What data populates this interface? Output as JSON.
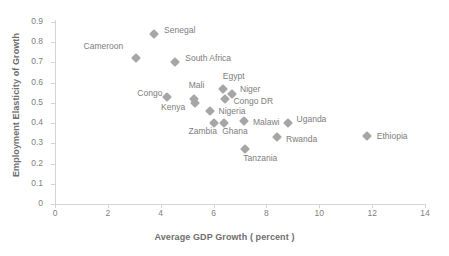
{
  "chart_data": {
    "type": "scatter",
    "title": "",
    "xlabel": "Average GDP Growth ( percent )",
    "ylabel": "Employment Elasticity of Growth",
    "xlim": [
      0,
      14
    ],
    "ylim": [
      0,
      0.9
    ],
    "xticks": [
      "0",
      "2",
      "4",
      "6",
      "8",
      "10",
      "12",
      "14"
    ],
    "yticks": [
      "0",
      "0.1",
      "0.2",
      "0.3",
      "0.4",
      "0.5",
      "0.6",
      "0.7",
      "0.8",
      "0.9"
    ],
    "grid": false,
    "legend": false,
    "marker_color": "#a6a6a6",
    "axis_color": "#d4d4d4",
    "points": [
      {
        "label": "Senegal",
        "x": 3.75,
        "y": 0.84,
        "lx": 10,
        "ly": -4
      },
      {
        "label": "Cameroon",
        "x": 3.05,
        "y": 0.72,
        "lx": -52,
        "ly": -12
      },
      {
        "label": "South Africa",
        "x": 4.55,
        "y": 0.7,
        "lx": 10,
        "ly": -4
      },
      {
        "label": "Congo",
        "x": 4.25,
        "y": 0.53,
        "lx": -30,
        "ly": -4
      },
      {
        "label": "Mali",
        "x": 5.25,
        "y": 0.52,
        "lx": -5,
        "ly": -14
      },
      {
        "label": "Kenya",
        "x": 5.3,
        "y": 0.5,
        "lx": -34,
        "ly": 4
      },
      {
        "label": "Egypt",
        "x": 6.35,
        "y": 0.57,
        "lx": 0,
        "ly": -13
      },
      {
        "label": "Niger",
        "x": 6.7,
        "y": 0.545,
        "lx": 8,
        "ly": -5
      },
      {
        "label": "Congo DR",
        "x": 6.45,
        "y": 0.52,
        "lx": 8,
        "ly": 2
      },
      {
        "label": "Nigeria",
        "x": 5.85,
        "y": 0.46,
        "lx": 9,
        "ly": 0
      },
      {
        "label": "Zambia",
        "x": 6.0,
        "y": 0.4,
        "lx": -25,
        "ly": 8
      },
      {
        "label": "Ghana",
        "x": 6.4,
        "y": 0.4,
        "lx": -2,
        "ly": 8
      },
      {
        "label": "Malawi",
        "x": 7.15,
        "y": 0.41,
        "lx": 9,
        "ly": 1
      },
      {
        "label": "Uganda",
        "x": 8.8,
        "y": 0.4,
        "lx": 9,
        "ly": -4
      },
      {
        "label": "Rwanda",
        "x": 8.4,
        "y": 0.33,
        "lx": 9,
        "ly": 2
      },
      {
        "label": "Tanzania",
        "x": 7.2,
        "y": 0.27,
        "lx": -2,
        "ly": 9
      },
      {
        "label": "Ethiopia",
        "x": 11.8,
        "y": 0.335,
        "lx": 10,
        "ly": 0
      }
    ]
  }
}
